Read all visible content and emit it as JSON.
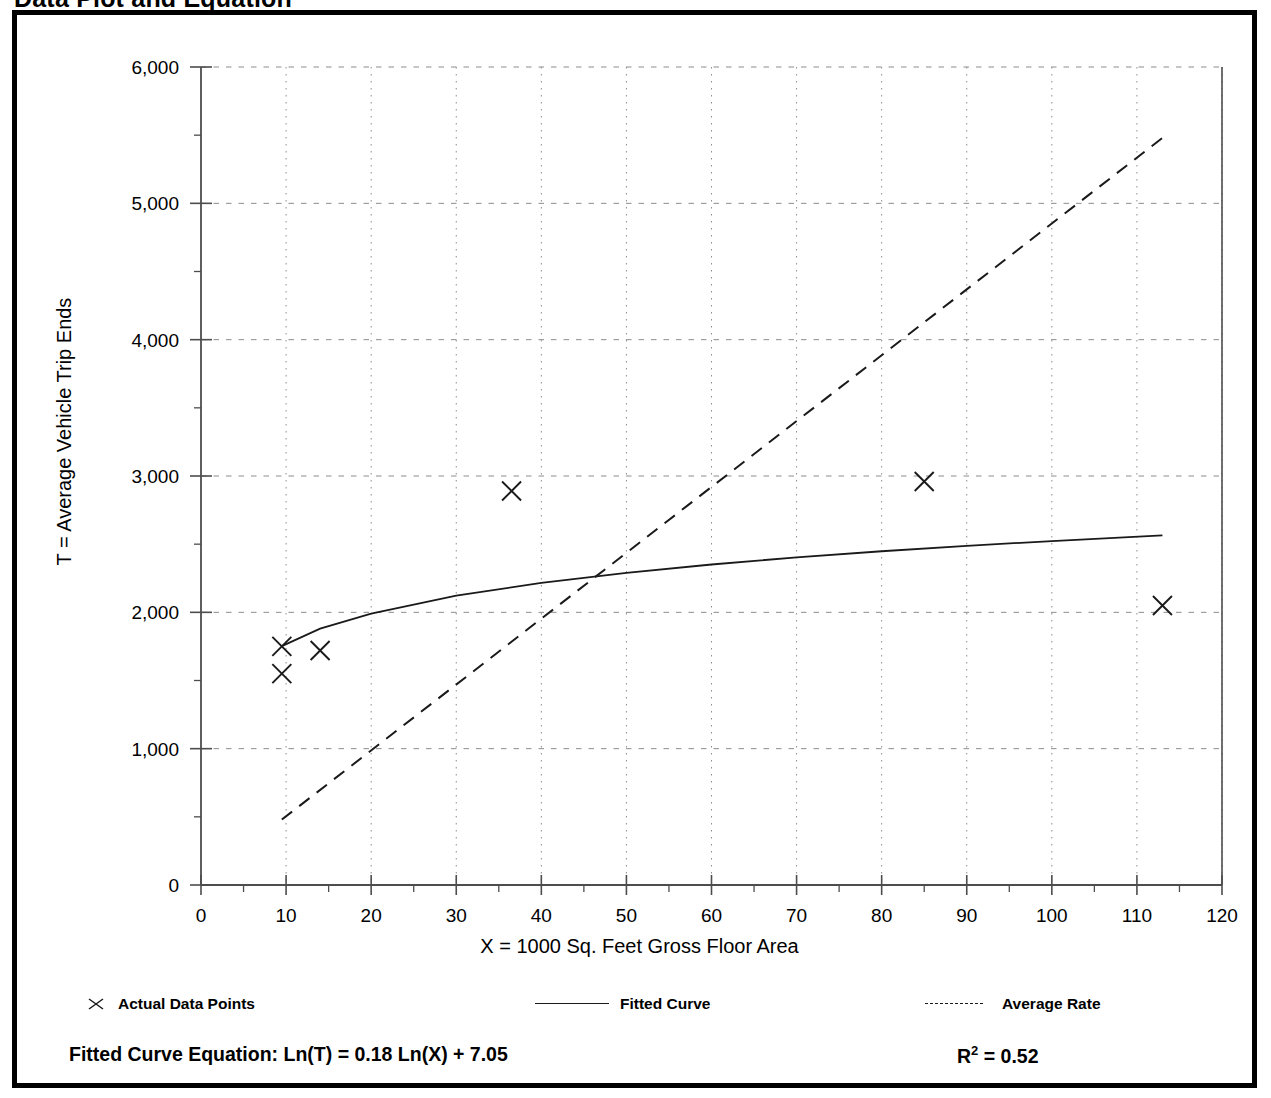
{
  "page": {
    "title": "Data Plot and Equation"
  },
  "chart_data": {
    "type": "scatter",
    "title": "Data Plot and Equation",
    "xlabel": "X = 1000 Sq. Feet Gross Floor Area",
    "ylabel": "T = Average Vehicle Trip Ends",
    "xlim": [
      0,
      120
    ],
    "ylim": [
      0,
      6000
    ],
    "x_ticks": [
      0,
      10,
      20,
      30,
      40,
      50,
      60,
      70,
      80,
      90,
      100,
      110,
      120
    ],
    "y_ticks": [
      0,
      1000,
      2000,
      3000,
      4000,
      5000,
      6000
    ],
    "x_tick_labels": [
      "0",
      "10",
      "20",
      "30",
      "40",
      "50",
      "60",
      "70",
      "80",
      "90",
      "100",
      "110",
      "120"
    ],
    "y_tick_labels": [
      "0",
      "1,000",
      "2,000",
      "3,000",
      "4,000",
      "5,000",
      "6,000"
    ],
    "x_minor_step": 5,
    "y_minor_step": 500,
    "grid": true,
    "grid_style": "dotted",
    "legend_position": "below-axes",
    "series": [
      {
        "name": "Actual Data Points",
        "type": "scatter",
        "marker": "x",
        "points": [
          {
            "x": 9.5,
            "y": 1750
          },
          {
            "x": 9.5,
            "y": 1550
          },
          {
            "x": 14.0,
            "y": 1720
          },
          {
            "x": 36.5,
            "y": 2890
          },
          {
            "x": 85.0,
            "y": 2960
          },
          {
            "x": 113.0,
            "y": 2050
          }
        ]
      },
      {
        "name": "Fitted Curve",
        "type": "line",
        "style": "solid",
        "equation": "Ln(T) = 0.18 Ln(X) + 7.05",
        "x_range": [
          9.5,
          113.0
        ],
        "points": [
          {
            "x": 9.5,
            "y": 1752
          },
          {
            "x": 14.0,
            "y": 1880
          },
          {
            "x": 20.0,
            "y": 1990
          },
          {
            "x": 30.0,
            "y": 2122
          },
          {
            "x": 40.0,
            "y": 2216
          },
          {
            "x": 50.0,
            "y": 2290
          },
          {
            "x": 60.0,
            "y": 2351
          },
          {
            "x": 70.0,
            "y": 2403
          },
          {
            "x": 80.0,
            "y": 2448
          },
          {
            "x": 90.0,
            "y": 2488
          },
          {
            "x": 100.0,
            "y": 2523
          },
          {
            "x": 113.0,
            "y": 2565
          }
        ]
      },
      {
        "name": "Average Rate",
        "type": "line",
        "style": "dashed",
        "points": [
          {
            "x": 9.5,
            "y": 480
          },
          {
            "x": 113.0,
            "y": 5480
          }
        ]
      }
    ],
    "annotations": {
      "equation_label": "Fitted Curve Equation:  Ln(T) = 0.18 Ln(X) + 7.05",
      "r_squared_label": "R2 = 0.52",
      "r_squared_value": "0.52"
    }
  },
  "legend": {
    "items": [
      {
        "label": "Actual Data Points",
        "marker": "x-marker-icon"
      },
      {
        "label": "Fitted Curve",
        "marker": "solid-line-icon"
      },
      {
        "label": "Average Rate",
        "marker": "dashed-line-icon"
      }
    ]
  },
  "equation": {
    "prefix": "Fitted Curve Equation:",
    "formula": "Ln(T) = 0.18 Ln(X) + 7.05",
    "full": "Fitted Curve Equation:  Ln(T) = 0.18 Ln(X) + 7.05",
    "r_label": "R",
    "r_exponent": "2",
    "r_value": "= 0.52"
  },
  "colors": {
    "frame": "#000000",
    "grid": "#8c8c8c",
    "axis": "#4d4d4d",
    "series": "#1a1a1a",
    "background": "#ffffff"
  }
}
